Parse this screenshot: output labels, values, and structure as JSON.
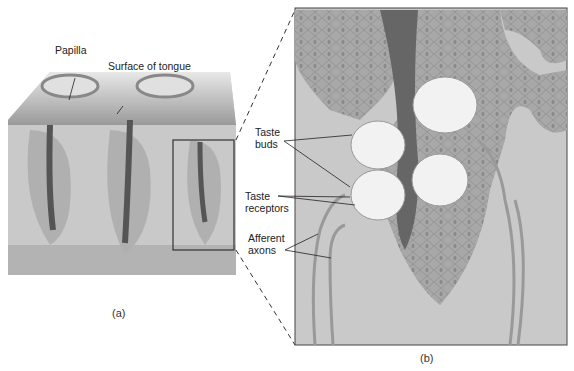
{
  "figure": {
    "panel_a": {
      "caption": "(a)",
      "labels": {
        "papilla": "Papilla",
        "surface": "Surface of tongue"
      }
    },
    "panel_b": {
      "caption": "(b)",
      "labels": {
        "taste_buds_1": "Taste",
        "taste_buds_2": "buds",
        "taste_receptors_1": "Taste",
        "taste_receptors_2": "receptors",
        "afferent_1": "Afferent",
        "afferent_2": "axons"
      }
    },
    "colors": {
      "tissue": "#c8c8c8",
      "epithelium": "#a9a9a9",
      "pore": "#6a6a6a",
      "bud": "#f2f2f2",
      "outline": "#333333"
    }
  }
}
